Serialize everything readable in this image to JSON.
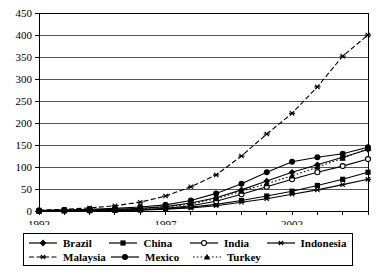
{
  "chart_data": {
    "type": "line",
    "title": "",
    "xlabel": "",
    "ylabel": "",
    "ylim": [
      0,
      450
    ],
    "ytick_step": 50,
    "yticks": [
      0,
      50,
      100,
      150,
      200,
      250,
      300,
      350,
      400,
      450
    ],
    "xlim": [
      1992,
      2005
    ],
    "x": [
      1992,
      1993,
      1994,
      1995,
      1996,
      1997,
      1998,
      1999,
      2000,
      2001,
      2002,
      2003,
      2004,
      2005
    ],
    "xticks_labeled": [
      1992,
      1997,
      2002
    ],
    "grid": "horizontal",
    "legend_position": "bottom",
    "series": [
      {
        "name": "Brazil",
        "marker": "diamond",
        "line": "solid",
        "color": "#000000",
        "values": [
          1,
          2,
          3,
          4,
          6,
          10,
          18,
          30,
          48,
          68,
          88,
          105,
          122,
          140
        ]
      },
      {
        "name": "China",
        "marker": "square",
        "line": "solid",
        "color": "#000000",
        "values": [
          0,
          1,
          1,
          2,
          3,
          5,
          9,
          15,
          24,
          34,
          45,
          58,
          72,
          88
        ]
      },
      {
        "name": "India",
        "marker": "open-circle",
        "line": "solid",
        "color": "#000000",
        "values": [
          0,
          1,
          1,
          2,
          3,
          6,
          12,
          22,
          38,
          55,
          72,
          88,
          102,
          118
        ]
      },
      {
        "name": "Indonesia",
        "marker": "asterisk",
        "line": "solid",
        "color": "#000000",
        "values": [
          0,
          0,
          1,
          1,
          2,
          4,
          7,
          12,
          20,
          28,
          38,
          48,
          60,
          72
        ]
      },
      {
        "name": "Malaysia",
        "marker": "asterisk",
        "line": "dashed",
        "color": "#000000",
        "values": [
          2,
          4,
          7,
          12,
          20,
          34,
          55,
          82,
          125,
          175,
          222,
          282,
          352,
          400
        ]
      },
      {
        "name": "Mexico",
        "marker": "filled-circle",
        "line": "solid",
        "color": "#000000",
        "values": [
          1,
          2,
          4,
          6,
          9,
          14,
          24,
          40,
          62,
          88,
          112,
          122,
          130,
          145
        ]
      },
      {
        "name": "Turkey",
        "marker": "triangle",
        "line": "dotted",
        "color": "#000000",
        "values": [
          0,
          1,
          2,
          3,
          5,
          9,
          16,
          28,
          45,
          62,
          80,
          100,
          120,
          142
        ]
      }
    ]
  },
  "legend": {
    "row1": [
      {
        "label": "Brazil",
        "key": "solid-diamond"
      },
      {
        "label": "China",
        "key": "solid-square"
      },
      {
        "label": "India",
        "key": "solid-open-circle"
      },
      {
        "label": "Indonesia",
        "key": "solid-asterisk"
      }
    ],
    "row2": [
      {
        "label": "Malaysia",
        "key": "dashed-asterisk"
      },
      {
        "label": "Mexico",
        "key": "solid-filled-circle"
      },
      {
        "label": "Turkey",
        "key": "dotted-triangle"
      }
    ]
  }
}
